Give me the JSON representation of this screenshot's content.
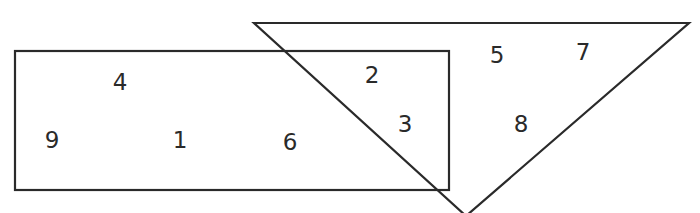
{
  "diagram": {
    "type": "venn",
    "stroke_color": "#2a2a2a",
    "rectangle": {
      "label": "rectangle",
      "x": 15,
      "y": 51,
      "width": 434,
      "height": 139,
      "numbers_only": [
        "4",
        "9",
        "1",
        "6"
      ]
    },
    "triangle": {
      "label": "triangle",
      "points": "254,23 689,23 466,216",
      "numbers_only": [
        "5",
        "7",
        "8"
      ]
    },
    "intersection": {
      "numbers": [
        "2",
        "3"
      ]
    },
    "numbers": [
      {
        "value": "4",
        "x": 120,
        "y": 82,
        "region": "rectangle"
      },
      {
        "value": "9",
        "x": 52,
        "y": 140,
        "region": "rectangle"
      },
      {
        "value": "1",
        "x": 180,
        "y": 140,
        "region": "rectangle"
      },
      {
        "value": "6",
        "x": 290,
        "y": 142,
        "region": "rectangle"
      },
      {
        "value": "2",
        "x": 372,
        "y": 75,
        "region": "intersection"
      },
      {
        "value": "3",
        "x": 405,
        "y": 124,
        "region": "intersection"
      },
      {
        "value": "5",
        "x": 497,
        "y": 55,
        "region": "triangle"
      },
      {
        "value": "7",
        "x": 583,
        "y": 52,
        "region": "triangle"
      },
      {
        "value": "8",
        "x": 521,
        "y": 124,
        "region": "triangle"
      }
    ]
  }
}
